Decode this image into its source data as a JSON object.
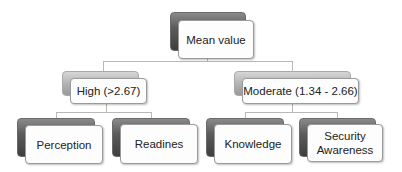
{
  "diagram": {
    "root": {
      "label": "Mean value"
    },
    "categories": [
      {
        "label": "High (>2.67)",
        "children": [
          {
            "label": "Perception"
          },
          {
            "label": "Readines"
          }
        ]
      },
      {
        "label": "Moderate (1.34 - 2.66)",
        "children": [
          {
            "label": "Knowledge"
          },
          {
            "label": "Security Awareness"
          }
        ]
      }
    ]
  },
  "colors": {
    "connector": "#b8b8b8",
    "box_fill": "#fdfdfd",
    "box_border": "#9a9a9a",
    "shadow_dark": "#4a4a4a",
    "shadow_light": "#b4b4b4",
    "text": "#222222"
  }
}
